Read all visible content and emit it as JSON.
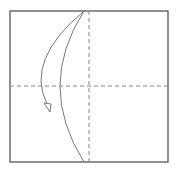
{
  "diagram": {
    "type": "origami-fold-step",
    "colors": {
      "paper_edge": "#555555",
      "crease": "#888888",
      "fold_line": "#777777",
      "arrow": "#777777",
      "background": "#ffffff"
    },
    "paper": {
      "x": 10,
      "y": 11,
      "width": 158,
      "height": 151
    },
    "creases": [
      {
        "name": "vertical-crease",
        "x1": 89,
        "y1": 11,
        "x2": 89,
        "y2": 162
      },
      {
        "name": "horizontal-crease",
        "x1": 10,
        "y1": 86,
        "x2": 168,
        "y2": 86
      }
    ],
    "fold_curve": "M84,11 Q36,86 84,162",
    "arrow_path": "M84,11 Q25,60 47,104",
    "arrow_head": "44,103 51,104 50,112"
  }
}
